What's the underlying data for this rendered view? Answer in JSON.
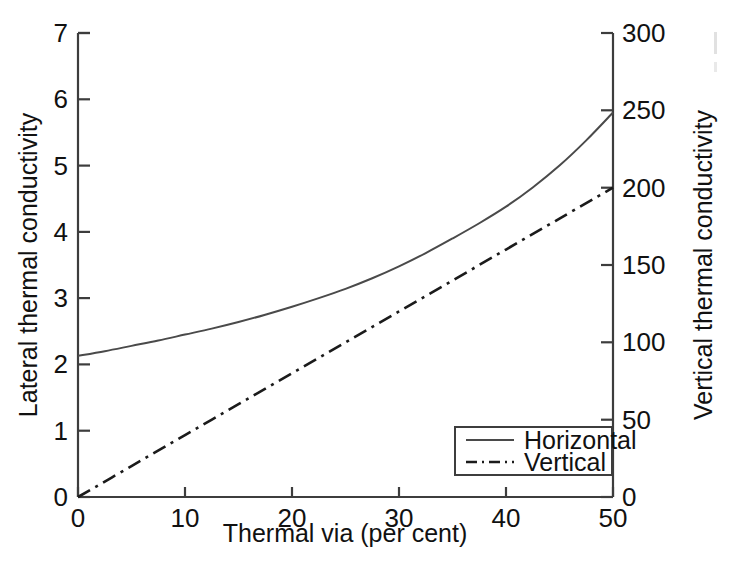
{
  "figure": {
    "background_color": "#ffffff",
    "ink_color": "#1b1b1b",
    "width": 730,
    "height": 571
  },
  "chart_data": {
    "type": "line",
    "title": "",
    "xlabel": "Thermal via (per cent)",
    "ylabel": "Lateral thermal conductivity",
    "y2label": "Vertical thermal conductivity",
    "xlim": [
      0,
      50
    ],
    "ylim": [
      0,
      7
    ],
    "y2lim": [
      0,
      300
    ],
    "xticks": [
      0,
      10,
      20,
      30,
      40,
      50
    ],
    "xticklabels": [
      "0",
      "10",
      "20",
      "30",
      "40",
      "50"
    ],
    "yticks": [
      0,
      1,
      2,
      3,
      4,
      5,
      6,
      7
    ],
    "yticklabels": [
      "0",
      "1",
      "2",
      "3",
      "4",
      "5",
      "6",
      "7"
    ],
    "y2ticks": [
      0,
      50,
      100,
      150,
      200,
      250,
      300
    ],
    "y2ticklabels": [
      "0",
      "50",
      "100",
      "150",
      "200",
      "250",
      "300"
    ],
    "grid": false,
    "legend_position": "lower right",
    "series": [
      {
        "name": "Horizontal",
        "axis": "left",
        "style": "solid",
        "color": "#4a4a4a",
        "x": [
          0,
          2.5,
          5,
          7.5,
          10,
          12.5,
          15,
          17.5,
          20,
          22.5,
          25,
          27.5,
          30,
          32.5,
          35,
          37.5,
          40,
          42.5,
          45,
          47.5,
          50
        ],
        "y": [
          2.13,
          2.2,
          2.28,
          2.36,
          2.45,
          2.54,
          2.64,
          2.75,
          2.87,
          3.0,
          3.14,
          3.3,
          3.48,
          3.68,
          3.9,
          4.13,
          4.38,
          4.67,
          5.0,
          5.38,
          5.8
        ]
      },
      {
        "name": "Vertical",
        "axis": "right",
        "style": "dash-dot",
        "color": "#1b1b1b",
        "x": [
          0,
          5,
          10,
          15,
          20,
          25,
          30,
          35,
          40,
          45,
          50
        ],
        "y": [
          0,
          20,
          40,
          60,
          80,
          100,
          120,
          140,
          160,
          180,
          200
        ]
      }
    ]
  },
  "legend": {
    "entries": [
      {
        "label": "Horizontal",
        "style": "solid"
      },
      {
        "label": "Vertical",
        "style": "dash-dot"
      }
    ]
  }
}
